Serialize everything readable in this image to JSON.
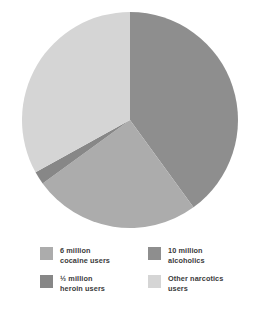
{
  "chart_data": {
    "type": "pie",
    "title": "",
    "subtitle": "",
    "xlabel": "",
    "ylabel": "",
    "grid": false,
    "legend_position": "bottom",
    "center": {
      "x": 130,
      "y": 120
    },
    "radius": 108,
    "start_angle_deg": -90,
    "direction": "clockwise",
    "categories": [
      "10 million alcoholics",
      "6 million cocaine users",
      "½ million heroin users",
      "Other narcotics users"
    ],
    "values": [
      40,
      25,
      2,
      33
    ],
    "value_unit": "percent of pie",
    "slices": [
      {
        "name": "alcoholics",
        "label": "10 million\nalcoholics",
        "amount": "10 million",
        "who": "alcoholics",
        "percent": 40,
        "color": "#8e8e8e",
        "start_deg": -90,
        "end_deg": 54
      },
      {
        "name": "cocaine-users",
        "label": "6 million\ncocaine users",
        "amount": "6 million",
        "who": "cocaine users",
        "percent": 25,
        "color": "#acacac",
        "start_deg": 54,
        "end_deg": 144
      },
      {
        "name": "heroin-users",
        "label": "½ million\nheroin users",
        "amount": "½ million",
        "who": "heroin users",
        "percent": 2,
        "color": "#878787",
        "start_deg": 144,
        "end_deg": 151
      },
      {
        "name": "other-narcotics-users",
        "label": "Other narcotics\nusers",
        "amount": "",
        "who": "Other narcotics users",
        "percent": 33,
        "color": "#d5d5d5",
        "start_deg": 151,
        "end_deg": 270
      }
    ]
  },
  "legend": {
    "items": [
      {
        "label": "6 million\ncocaine users",
        "color": "#acacac",
        "swatch_name": "legend-swatch-cocaine"
      },
      {
        "label": "10 million\nalcoholics",
        "color": "#8e8e8e",
        "swatch_name": "legend-swatch-alcoholics"
      },
      {
        "label": "½ million\nheroin users",
        "color": "#878787",
        "swatch_name": "legend-swatch-heroin"
      },
      {
        "label": "Other narcotics\nusers",
        "color": "#d5d5d5",
        "swatch_name": "legend-swatch-other-narcotics"
      }
    ]
  },
  "colors": {
    "background": "#ffffff",
    "text": "#3b3b3b",
    "slice_alcoholics": "#8e8e8e",
    "slice_cocaine": "#acacac",
    "slice_heroin": "#878787",
    "slice_other": "#d5d5d5"
  }
}
